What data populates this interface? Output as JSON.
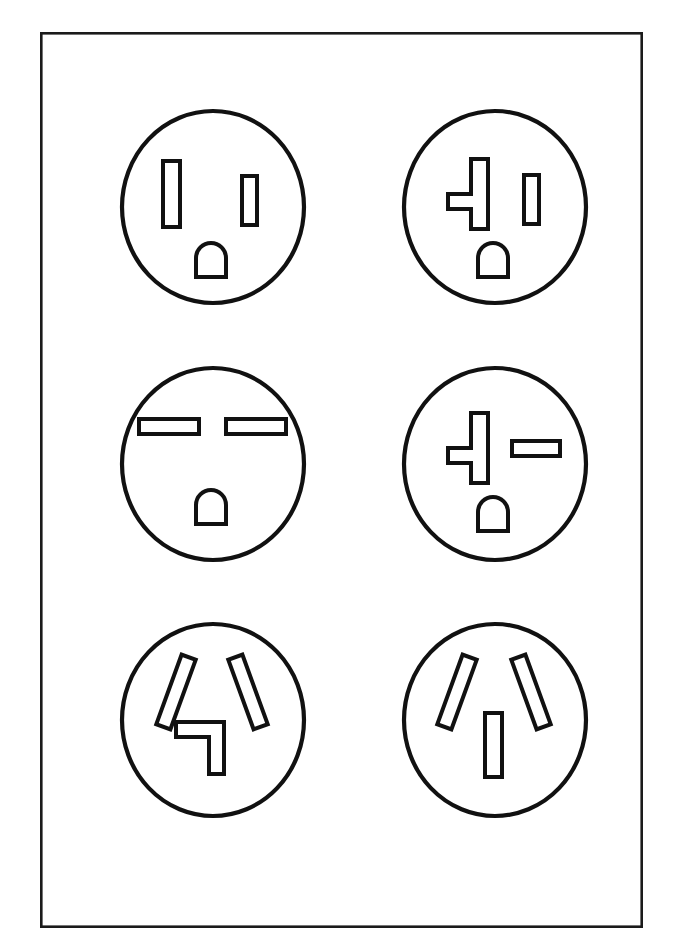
{
  "document": {
    "title": "NEMA Straight-Blade Receptacle Face Configurations",
    "description": "Line drawing sheet showing six round electrical receptacle faces arranged in a 3-row by 2-column grid inside a rectangular border.",
    "background_color": "#ffffff",
    "ink_color": "#111111",
    "border_color": "#1a1a1a"
  },
  "sheet": {
    "border": {
      "x": 40,
      "y": 32,
      "width": 603,
      "height": 896,
      "stroke_width": 2.6
    }
  },
  "chart_data": {
    "type": "diagram",
    "layout": "grid",
    "rows": 3,
    "columns": 2,
    "items": [
      {
        "index": 1,
        "name": "NEMA 5-15R",
        "row": 1,
        "column": 1,
        "center": [
          213,
          207
        ],
        "radius_x": 91,
        "radius_y": 96,
        "description": "Two parallel vertical slots with a D-shaped grounding hole below center",
        "slots": [
          {
            "id": "neutral",
            "shape": "vertical-bar",
            "x": 163,
            "y": 161,
            "width": 17,
            "height": 66,
            "orientation": "vertical"
          },
          {
            "id": "hot",
            "shape": "vertical-bar",
            "x": 242,
            "y": 176,
            "width": 15,
            "height": 49,
            "orientation": "vertical"
          },
          {
            "id": "ground",
            "shape": "d-shape",
            "x": 196,
            "y": 243,
            "width": 30,
            "height": 34,
            "orientation": "dome-up"
          }
        ]
      },
      {
        "index": 2,
        "name": "NEMA 5-20R",
        "row": 1,
        "column": 2,
        "center": [
          495,
          207
        ],
        "radius_x": 91,
        "radius_y": 96,
        "description": "T-shaped vertical slot with left-facing branch, vertical slot at right, D-shaped grounding hole below center",
        "slots": [
          {
            "id": "neutral",
            "shape": "t-shape",
            "x": 448,
            "y": 159,
            "width": 40,
            "height": 70,
            "orientation": "branch-left"
          },
          {
            "id": "hot",
            "shape": "vertical-bar",
            "x": 524,
            "y": 175,
            "width": 15,
            "height": 49,
            "orientation": "vertical"
          },
          {
            "id": "ground",
            "shape": "d-shape",
            "x": 478,
            "y": 243,
            "width": 30,
            "height": 34,
            "orientation": "dome-up"
          }
        ]
      },
      {
        "index": 3,
        "name": "NEMA 6-15R",
        "row": 2,
        "column": 1,
        "center": [
          213,
          464
        ],
        "radius_x": 91,
        "radius_y": 96,
        "description": "Two parallel horizontal slots side by side with a D-shaped grounding hole below center",
        "slots": [
          {
            "id": "hot-1",
            "shape": "horizontal-bar",
            "x": 139,
            "y": 419,
            "width": 60,
            "height": 15,
            "orientation": "horizontal"
          },
          {
            "id": "hot-2",
            "shape": "horizontal-bar",
            "x": 226,
            "y": 419,
            "width": 60,
            "height": 15,
            "orientation": "horizontal"
          },
          {
            "id": "ground",
            "shape": "d-shape",
            "x": 196,
            "y": 490,
            "width": 30,
            "height": 34,
            "orientation": "dome-up"
          }
        ]
      },
      {
        "index": 4,
        "name": "NEMA 6-20R",
        "row": 2,
        "column": 2,
        "center": [
          495,
          464
        ],
        "radius_x": 91,
        "radius_y": 96,
        "description": "T-shaped vertical slot with left-facing branch, horizontal slot at right, D-shaped grounding hole below center",
        "slots": [
          {
            "id": "hot-1",
            "shape": "t-shape",
            "x": 448,
            "y": 413,
            "width": 40,
            "height": 70,
            "orientation": "branch-left"
          },
          {
            "id": "hot-2",
            "shape": "horizontal-bar",
            "x": 512,
            "y": 441,
            "width": 48,
            "height": 15,
            "orientation": "horizontal"
          },
          {
            "id": "ground",
            "shape": "d-shape",
            "x": 478,
            "y": 497,
            "width": 30,
            "height": 34,
            "orientation": "dome-up"
          }
        ]
      },
      {
        "index": 5,
        "name": "NEMA 10-30R",
        "row": 3,
        "column": 1,
        "center": [
          213,
          720
        ],
        "radius_x": 91,
        "radius_y": 96,
        "description": "Two slanted slots forming a V with an L-shaped neutral slot below center",
        "slots": [
          {
            "id": "hot-1",
            "shape": "slanted-bar",
            "angle_deg": 20,
            "length": 74,
            "thickness": 15,
            "center": [
              176,
              692
            ]
          },
          {
            "id": "hot-2",
            "shape": "slanted-bar",
            "angle_deg": -20,
            "length": 74,
            "thickness": 15,
            "center": [
              248,
              692
            ]
          },
          {
            "id": "neutral",
            "shape": "l-shape",
            "x": 176,
            "y": 722,
            "width": 48,
            "height": 52,
            "orientation": "corner-top-right"
          }
        ]
      },
      {
        "index": 6,
        "name": "NEMA 10-50R",
        "row": 3,
        "column": 2,
        "center": [
          495,
          720
        ],
        "radius_x": 91,
        "radius_y": 96,
        "description": "Two slanted slots forming a V with a straight vertical neutral slot below center",
        "slots": [
          {
            "id": "hot-1",
            "shape": "slanted-bar",
            "angle_deg": 20,
            "length": 74,
            "thickness": 15,
            "center": [
              457,
              692
            ]
          },
          {
            "id": "hot-2",
            "shape": "slanted-bar",
            "angle_deg": -20,
            "length": 74,
            "thickness": 15,
            "center": [
              531,
              692
            ]
          },
          {
            "id": "neutral",
            "shape": "vertical-bar",
            "x": 485,
            "y": 713,
            "width": 17,
            "height": 64,
            "orientation": "vertical"
          }
        ]
      }
    ]
  }
}
